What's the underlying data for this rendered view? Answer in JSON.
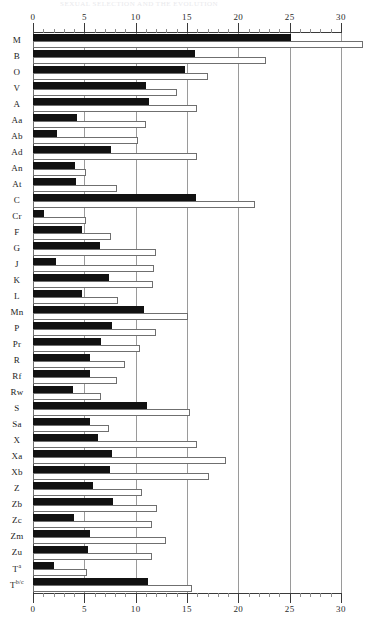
{
  "page": {
    "header_faint": "SEXUAL SELECTION AND THE EVOLUTION",
    "page_number": "9"
  },
  "axis": {
    "tick_labels": [
      "0",
      "5",
      "10",
      "15",
      "20",
      "25",
      "30"
    ],
    "tick_values": [
      0,
      5,
      10,
      15,
      20,
      25,
      30
    ],
    "minor_step": 1,
    "xmin": 0,
    "xmax": 30,
    "gridlines": true
  },
  "legend": {
    "series_black": "black",
    "series_white": "white"
  },
  "colors": {
    "series_black": "#111111",
    "series_white": "#ffffff",
    "series_white_border": "#6f6f6f",
    "gridline": "#9a9a9a",
    "axis": "#3a3a3a",
    "text": "#1b1b1b",
    "background": "#ffffff"
  },
  "chart_data": {
    "type": "bar",
    "orientation": "horizontal",
    "title": "",
    "subtitle": "",
    "xlabel": "",
    "ylabel": "",
    "xlim": [
      0,
      30
    ],
    "grid": true,
    "legend_position": "none",
    "categories": [
      "M",
      "B",
      "O",
      "V",
      "A",
      "Aa",
      "Ab",
      "Ad",
      "An",
      "At",
      "C",
      "Cr",
      "F",
      "G",
      "J",
      "K",
      "L",
      "Mn",
      "P",
      "Pr",
      "R",
      "Rf",
      "Rw",
      "S",
      "Sa",
      "X",
      "Xa",
      "Xb",
      "Z",
      "Zb",
      "Zc",
      "Zm",
      "Zu",
      "Tᵃ",
      "Tᵇᐟᶜ"
    ],
    "category_labels_html": [
      "M",
      "B",
      "O",
      "V",
      "A",
      "Aa",
      "Ab",
      "Ad",
      "An",
      "At",
      "C",
      "Cr",
      "F",
      "G",
      "J",
      "K",
      "L",
      "Mn",
      "P",
      "Pr",
      "R",
      "Rf",
      "Rw",
      "S",
      "Sa",
      "X",
      "Xa",
      "Xb",
      "Z",
      "Zb",
      "Zc",
      "Zm",
      "Zu",
      "T<sup>a</sup>",
      "T<sup>b/c</sup>"
    ],
    "series": [
      {
        "name": "black",
        "values": [
          25.1,
          15.8,
          14.8,
          11.0,
          11.3,
          4.3,
          2.3,
          7.6,
          4.1,
          4.2,
          15.9,
          1.1,
          4.8,
          6.5,
          2.2,
          7.4,
          4.8,
          10.8,
          7.7,
          6.6,
          5.6,
          5.6,
          3.9,
          11.1,
          5.6,
          6.3,
          7.7,
          7.5,
          5.8,
          7.8,
          4.0,
          5.6,
          5.4,
          2.0,
          11.2
        ]
      },
      {
        "name": "white",
        "values": [
          32.1,
          22.7,
          17.0,
          14.0,
          16.0,
          11.0,
          10.2,
          16.0,
          5.2,
          8.2,
          21.6,
          5.2,
          7.6,
          12.0,
          11.8,
          11.7,
          8.3,
          15.1,
          12.0,
          10.4,
          9.0,
          8.2,
          6.6,
          15.3,
          7.4,
          16.0,
          18.8,
          17.1,
          10.6,
          12.1,
          11.6,
          13.0,
          11.6,
          5.3,
          15.5
        ]
      }
    ]
  }
}
